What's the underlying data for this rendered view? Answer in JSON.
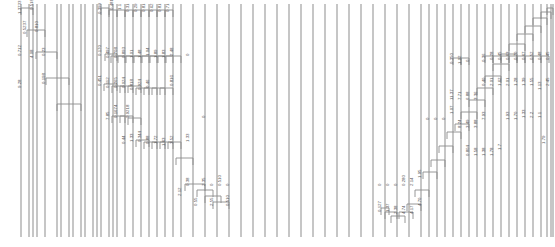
{
  "figure": {
    "type": "dendrogram",
    "orientation": "rotated-90-leaves-vertical",
    "width": 555,
    "height": 247,
    "background_color": "#ffffff",
    "line_color": "#8d8d8d",
    "label_color": "#5a5a5a",
    "label_orientation": "vertical-rotated",
    "title": "",
    "xlabel": "",
    "ylabel": ""
  },
  "chart_data": {
    "type": "line",
    "title": "",
    "subtitle": "",
    "xlabel": "",
    "ylabel": "",
    "grid": false,
    "legend": "none",
    "axis_ranges": {
      "x": [
        0,
        555
      ],
      "y": [
        0,
        247
      ]
    },
    "leaf_count": 63,
    "leaf_x": [
      21,
      33,
      45,
      57,
      69,
      81,
      93,
      101,
      109,
      117,
      125,
      133,
      141,
      149,
      157,
      165,
      173,
      181,
      193,
      205,
      217,
      229,
      241,
      253,
      265,
      277,
      289,
      301,
      313,
      325,
      337,
      349,
      361,
      373,
      385,
      397,
      409,
      421,
      429,
      437,
      445,
      453,
      461,
      469,
      477,
      485,
      493,
      501,
      509,
      517,
      525,
      533,
      541,
      547,
      551,
      553,
      29,
      37,
      61,
      73,
      85,
      97,
      113
    ],
    "labels": [
      {
        "text": "1.3733",
        "x": 21,
        "y": 14
      },
      {
        "text": "0.518",
        "x": 33,
        "y": 10
      },
      {
        "text": "0.5237",
        "x": 26,
        "y": 34
      },
      {
        "text": "0.810",
        "x": 38,
        "y": 32
      },
      {
        "text": "0.712",
        "x": 21,
        "y": 56
      },
      {
        "text": "4.08",
        "x": 33,
        "y": 58
      },
      {
        "text": "0.23",
        "x": 45,
        "y": 56
      },
      {
        "text": "9.28",
        "x": 21,
        "y": 88
      },
      {
        "text": "0.198",
        "x": 45,
        "y": 84
      },
      {
        "text": "0.399",
        "x": 101,
        "y": 14
      },
      {
        "text": "0.481",
        "x": 113,
        "y": 10
      },
      {
        "text": "1.1",
        "x": 121,
        "y": 10
      },
      {
        "text": "0.31",
        "x": 129,
        "y": 12
      },
      {
        "text": "0.29",
        "x": 137,
        "y": 12
      },
      {
        "text": "0.81",
        "x": 145,
        "y": 12
      },
      {
        "text": "0.62",
        "x": 153,
        "y": 12
      },
      {
        "text": "0.81",
        "x": 161,
        "y": 12
      },
      {
        "text": "0.71",
        "x": 169,
        "y": 12
      },
      {
        "text": "0.170",
        "x": 101,
        "y": 56
      },
      {
        "text": "0.497",
        "x": 109,
        "y": 58
      },
      {
        "text": "0.708",
        "x": 117,
        "y": 58
      },
      {
        "text": "0.893",
        "x": 125,
        "y": 58
      },
      {
        "text": "1.01",
        "x": 133,
        "y": 58
      },
      {
        "text": "1.48",
        "x": 141,
        "y": 58
      },
      {
        "text": "1.04",
        "x": 149,
        "y": 56
      },
      {
        "text": "1.89",
        "x": 157,
        "y": 58
      },
      {
        "text": "1.83",
        "x": 165,
        "y": 58
      },
      {
        "text": "2.48",
        "x": 173,
        "y": 56
      },
      {
        "text": "0",
        "x": 189,
        "y": 56
      },
      {
        "text": "0.451",
        "x": 101,
        "y": 86
      },
      {
        "text": "0.112",
        "x": 109,
        "y": 88
      },
      {
        "text": "0.265",
        "x": 117,
        "y": 88
      },
      {
        "text": "0.024",
        "x": 125,
        "y": 88
      },
      {
        "text": "0.818",
        "x": 133,
        "y": 90
      },
      {
        "text": "0.924",
        "x": 141,
        "y": 90
      },
      {
        "text": "0.46",
        "x": 149,
        "y": 88
      },
      {
        "text": "0.816",
        "x": 173,
        "y": 86
      },
      {
        "text": "7.85",
        "x": 109,
        "y": 120
      },
      {
        "text": "0.1674",
        "x": 117,
        "y": 118
      },
      {
        "text": "0.9218",
        "x": 129,
        "y": 118
      },
      {
        "text": "0.44",
        "x": 125,
        "y": 144
      },
      {
        "text": "1.33",
        "x": 133,
        "y": 142
      },
      {
        "text": "0.344",
        "x": 141,
        "y": 142
      },
      {
        "text": "0.88",
        "x": 149,
        "y": 144
      },
      {
        "text": "1.72",
        "x": 157,
        "y": 144
      },
      {
        "text": "1.63",
        "x": 165,
        "y": 146
      },
      {
        "text": "3.52",
        "x": 173,
        "y": 144
      },
      {
        "text": "1.33",
        "x": 189,
        "y": 142
      },
      {
        "text": "0",
        "x": 205,
        "y": 118
      },
      {
        "text": "0.38",
        "x": 189,
        "y": 186
      },
      {
        "text": "2.35",
        "x": 205,
        "y": 186
      },
      {
        "text": "0",
        "x": 213,
        "y": 186
      },
      {
        "text": "0.510",
        "x": 221,
        "y": 186
      },
      {
        "text": "0",
        "x": 229,
        "y": 186
      },
      {
        "text": "0.55",
        "x": 197,
        "y": 206
      },
      {
        "text": "2.55",
        "x": 213,
        "y": 206
      },
      {
        "text": "0.510",
        "x": 229,
        "y": 206
      },
      {
        "text": "2.12",
        "x": 181,
        "y": 196
      },
      {
        "text": "0",
        "x": 381,
        "y": 186
      },
      {
        "text": "0.127",
        "x": 381,
        "y": 212
      },
      {
        "text": "0",
        "x": 389,
        "y": 186
      },
      {
        "text": "1.37",
        "x": 389,
        "y": 212
      },
      {
        "text": "0",
        "x": 397,
        "y": 186
      },
      {
        "text": "2.38",
        "x": 397,
        "y": 214
      },
      {
        "text": "0.280",
        "x": 405,
        "y": 186
      },
      {
        "text": "4.74",
        "x": 405,
        "y": 214
      },
      {
        "text": "2.14",
        "x": 413,
        "y": 186
      },
      {
        "text": "4.17",
        "x": 413,
        "y": 214
      },
      {
        "text": "1.95",
        "x": 421,
        "y": 178
      },
      {
        "text": "4.70",
        "x": 421,
        "y": 206
      },
      {
        "text": "0",
        "x": 429,
        "y": 120
      },
      {
        "text": "0",
        "x": 437,
        "y": 120
      },
      {
        "text": "0",
        "x": 445,
        "y": 120
      },
      {
        "text": "1.07",
        "x": 453,
        "y": 114
      },
      {
        "text": "0.350",
        "x": 453,
        "y": 64
      },
      {
        "text": "1.02",
        "x": 461,
        "y": 64
      },
      {
        "text": "0",
        "x": 469,
        "y": 62
      },
      {
        "text": "11.37",
        "x": 453,
        "y": 100
      },
      {
        "text": "7.71",
        "x": 461,
        "y": 100
      },
      {
        "text": "8.24",
        "x": 461,
        "y": 128
      },
      {
        "text": "3.49",
        "x": 469,
        "y": 128
      },
      {
        "text": "6.88",
        "x": 469,
        "y": 100
      },
      {
        "text": "3.36",
        "x": 477,
        "y": 100
      },
      {
        "text": "3.88",
        "x": 477,
        "y": 128
      },
      {
        "text": "0.804",
        "x": 469,
        "y": 156
      },
      {
        "text": "1.58",
        "x": 477,
        "y": 156
      },
      {
        "text": "1.38",
        "x": 485,
        "y": 156
      },
      {
        "text": "1.78",
        "x": 493,
        "y": 156
      },
      {
        "text": "1.7",
        "x": 501,
        "y": 150
      },
      {
        "text": "7.93",
        "x": 485,
        "y": 120
      },
      {
        "text": "0.36",
        "x": 485,
        "y": 62
      },
      {
        "text": "0.40",
        "x": 485,
        "y": 86
      },
      {
        "text": "0.28",
        "x": 493,
        "y": 60
      },
      {
        "text": "2.01",
        "x": 493,
        "y": 86
      },
      {
        "text": "0.45",
        "x": 501,
        "y": 60
      },
      {
        "text": "1.62",
        "x": 501,
        "y": 86
      },
      {
        "text": "0.63",
        "x": 509,
        "y": 60
      },
      {
        "text": "2.01",
        "x": 509,
        "y": 86
      },
      {
        "text": "0.70",
        "x": 517,
        "y": 60
      },
      {
        "text": "1.28",
        "x": 517,
        "y": 86
      },
      {
        "text": "0.67",
        "x": 525,
        "y": 60
      },
      {
        "text": "1.39",
        "x": 525,
        "y": 86
      },
      {
        "text": "0.52",
        "x": 533,
        "y": 60
      },
      {
        "text": "1.55",
        "x": 533,
        "y": 86
      },
      {
        "text": "0.48",
        "x": 541,
        "y": 60
      },
      {
        "text": "1.13",
        "x": 541,
        "y": 90
      },
      {
        "text": "0.45",
        "x": 549,
        "y": 60
      },
      {
        "text": "2.45",
        "x": 549,
        "y": 86
      },
      {
        "text": "1.93",
        "x": 509,
        "y": 120
      },
      {
        "text": "1.70",
        "x": 517,
        "y": 120
      },
      {
        "text": "1.33",
        "x": 525,
        "y": 118
      },
      {
        "text": "2.2",
        "x": 533,
        "y": 118
      },
      {
        "text": "1.1",
        "x": 541,
        "y": 118
      },
      {
        "text": "1.79",
        "x": 545,
        "y": 144
      }
    ],
    "merge_brackets": [
      {
        "x1": 21,
        "x2": 33,
        "y": 8
      },
      {
        "x1": 27,
        "x2": 45,
        "y": 30
      },
      {
        "x1": 36,
        "x2": 57,
        "y": 52
      },
      {
        "x1": 46,
        "x2": 69,
        "y": 78
      },
      {
        "x1": 57,
        "x2": 81,
        "y": 104
      },
      {
        "x1": 101,
        "x2": 109,
        "y": 8
      },
      {
        "x1": 109,
        "x2": 117,
        "y": 10
      },
      {
        "x1": 117,
        "x2": 125,
        "y": 10
      },
      {
        "x1": 125,
        "x2": 133,
        "y": 10
      },
      {
        "x1": 133,
        "x2": 141,
        "y": 10
      },
      {
        "x1": 141,
        "x2": 149,
        "y": 10
      },
      {
        "x1": 149,
        "x2": 157,
        "y": 10
      },
      {
        "x1": 157,
        "x2": 165,
        "y": 10
      },
      {
        "x1": 165,
        "x2": 173,
        "y": 10
      },
      {
        "x1": 105,
        "x2": 117,
        "y": 54
      },
      {
        "x1": 111,
        "x2": 125,
        "y": 56
      },
      {
        "x1": 118,
        "x2": 133,
        "y": 56
      },
      {
        "x1": 126,
        "x2": 141,
        "y": 56
      },
      {
        "x1": 134,
        "x2": 149,
        "y": 56
      },
      {
        "x1": 142,
        "x2": 157,
        "y": 56
      },
      {
        "x1": 150,
        "x2": 165,
        "y": 56
      },
      {
        "x1": 158,
        "x2": 173,
        "y": 56
      },
      {
        "x1": 166,
        "x2": 181,
        "y": 56
      },
      {
        "x1": 104,
        "x2": 117,
        "y": 84
      },
      {
        "x1": 112,
        "x2": 125,
        "y": 86
      },
      {
        "x1": 120,
        "x2": 133,
        "y": 86
      },
      {
        "x1": 128,
        "x2": 141,
        "y": 86
      },
      {
        "x1": 136,
        "x2": 149,
        "y": 88
      },
      {
        "x1": 144,
        "x2": 157,
        "y": 88
      },
      {
        "x1": 152,
        "x2": 165,
        "y": 88
      },
      {
        "x1": 160,
        "x2": 173,
        "y": 88
      },
      {
        "x1": 112,
        "x2": 125,
        "y": 116
      },
      {
        "x1": 120,
        "x2": 133,
        "y": 116
      },
      {
        "x1": 128,
        "x2": 141,
        "y": 118
      },
      {
        "x1": 136,
        "x2": 149,
        "y": 140
      },
      {
        "x1": 144,
        "x2": 157,
        "y": 142
      },
      {
        "x1": 152,
        "x2": 165,
        "y": 142
      },
      {
        "x1": 160,
        "x2": 173,
        "y": 142
      },
      {
        "x1": 168,
        "x2": 181,
        "y": 142
      },
      {
        "x1": 176,
        "x2": 193,
        "y": 158
      },
      {
        "x1": 185,
        "x2": 205,
        "y": 184
      },
      {
        "x1": 197,
        "x2": 213,
        "y": 190
      },
      {
        "x1": 205,
        "x2": 221,
        "y": 196
      },
      {
        "x1": 213,
        "x2": 229,
        "y": 202
      },
      {
        "x1": 381,
        "x2": 389,
        "y": 208
      },
      {
        "x1": 385,
        "x2": 397,
        "y": 212
      },
      {
        "x1": 391,
        "x2": 405,
        "y": 216
      },
      {
        "x1": 399,
        "x2": 413,
        "y": 212
      },
      {
        "x1": 407,
        "x2": 421,
        "y": 204
      },
      {
        "x1": 415,
        "x2": 429,
        "y": 190
      },
      {
        "x1": 423,
        "x2": 437,
        "y": 172
      },
      {
        "x1": 431,
        "x2": 445,
        "y": 160
      },
      {
        "x1": 439,
        "x2": 453,
        "y": 146
      },
      {
        "x1": 447,
        "x2": 461,
        "y": 132
      },
      {
        "x1": 455,
        "x2": 469,
        "y": 124
      },
      {
        "x1": 461,
        "x2": 477,
        "y": 112
      },
      {
        "x1": 469,
        "x2": 485,
        "y": 100
      },
      {
        "x1": 477,
        "x2": 493,
        "y": 88
      },
      {
        "x1": 485,
        "x2": 501,
        "y": 76
      },
      {
        "x1": 493,
        "x2": 509,
        "y": 64
      },
      {
        "x1": 501,
        "x2": 517,
        "y": 54
      },
      {
        "x1": 509,
        "x2": 525,
        "y": 44
      },
      {
        "x1": 517,
        "x2": 533,
        "y": 34
      },
      {
        "x1": 525,
        "x2": 541,
        "y": 26
      },
      {
        "x1": 533,
        "x2": 547,
        "y": 18
      },
      {
        "x1": 541,
        "x2": 551,
        "y": 12
      },
      {
        "x1": 547,
        "x2": 553,
        "y": 8
      },
      {
        "x1": 453,
        "x2": 461,
        "y": 58
      },
      {
        "x1": 461,
        "x2": 469,
        "y": 58
      },
      {
        "x1": 485,
        "x2": 493,
        "y": 56
      },
      {
        "x1": 493,
        "x2": 501,
        "y": 56
      },
      {
        "x1": 501,
        "x2": 509,
        "y": 56
      },
      {
        "x1": 509,
        "x2": 517,
        "y": 56
      },
      {
        "x1": 517,
        "x2": 525,
        "y": 56
      },
      {
        "x1": 525,
        "x2": 533,
        "y": 56
      },
      {
        "x1": 533,
        "x2": 541,
        "y": 56
      },
      {
        "x1": 541,
        "x2": 549,
        "y": 56
      }
    ]
  }
}
